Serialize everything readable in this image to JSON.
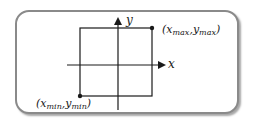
{
  "diagram": {
    "title": "",
    "axes": {
      "x_label": "x",
      "y_label": "y"
    },
    "points": {
      "max": {
        "open": "(",
        "x_base": "x",
        "x_sub": "max",
        "sep": ",",
        "y_base": "y",
        "y_sub": "max",
        "close": ")"
      },
      "min": {
        "open": "(",
        "x_base": "x",
        "x_sub": "min",
        "sep": ",",
        "y_base": "y",
        "y_sub": "min",
        "close": ")"
      }
    },
    "colors": {
      "frame_border": "#8a8a8a",
      "line": "#1a1a1a",
      "background": "#ffffff"
    }
  }
}
